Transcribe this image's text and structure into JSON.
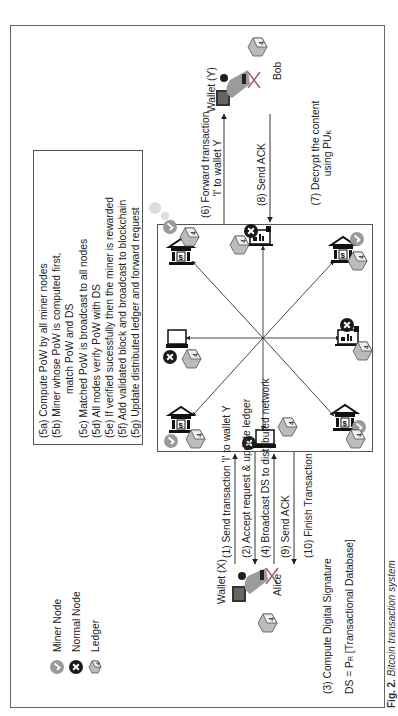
{
  "legend": [
    {
      "icon": "miner-node-icon",
      "label": "Miner Node",
      "color": "#9a9a9a"
    },
    {
      "icon": "normal-node-icon",
      "label": "Normal Node",
      "color": "#1a1a1a"
    },
    {
      "icon": "ledger-icon",
      "label": "Ledger",
      "color": "#8a8a8a"
    }
  ],
  "alice": {
    "wallet": "Wallet (X)",
    "name": "Alice"
  },
  "bob": {
    "wallet": "Wallet (Y)",
    "name": "Bob"
  },
  "left_steps": {
    "s1": "(1) Send transaction 'I' to wallet Y",
    "s2": "(2) Accept request & update ledger",
    "s4": "(4) Broadcast DS to distributed network",
    "s9": "(9) Send ACK",
    "s10": "(10) Finish Transaction",
    "s3_line1": "(3) Compute Digital Signature",
    "s3_line2_prefix": "DS = P",
    "s3_line2_sub": "R",
    "s3_line2_suffix": " [Transactional Database]"
  },
  "right_steps": {
    "s6_line1": "(6) Forward transaction",
    "s6_line2": "'I' to wallet Y",
    "s8": "(8) Send ACK",
    "s7_line1": "(7) Decrypt the content",
    "s7_line2_prefix": "using PU",
    "s7_line2_sub": "K"
  },
  "mining_steps": [
    "(5a) Compute PoW by all miner nodes",
    "(5b) Miner whose PoW is computed first,",
    "match PoW and DS",
    "(5c) Matched PoW is broadcast to all nodes",
    "(5d) All nodes verify PoW with DS",
    "(5e) If verified sucessfully then the miner is rewarded",
    "(5f) Add validated block and broadcast to blockchain",
    "(5g) Update distributed ledger and forward request"
  ],
  "network_nodes": [
    {
      "position": "top-left",
      "type": "bank",
      "role": "miner"
    },
    {
      "position": "top",
      "type": "mobile",
      "role": "normal"
    },
    {
      "position": "top-right",
      "type": "bank",
      "role": "miner"
    },
    {
      "position": "right",
      "type": "laptop",
      "role": "normal"
    },
    {
      "position": "bottom-right",
      "type": "bank",
      "role": "miner"
    },
    {
      "position": "bottom",
      "type": "mobile",
      "role": "normal"
    },
    {
      "position": "bottom-left",
      "type": "bank",
      "role": "miner"
    },
    {
      "position": "left",
      "type": "laptop",
      "role": "normal"
    }
  ],
  "caption": {
    "fig": "Fig. 2.",
    "text": "Bitcoin transaction system"
  },
  "colors": {
    "miner": "#9a9a9a",
    "normal": "#1a1a1a",
    "line": "#333333",
    "frame": "#666666"
  }
}
